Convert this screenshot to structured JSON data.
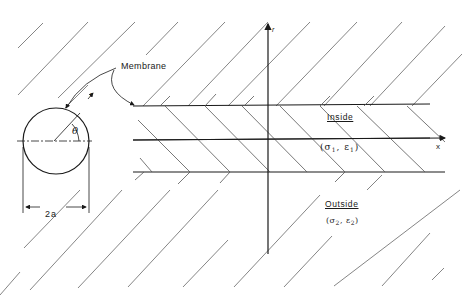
{
  "diagram": {
    "type": "cylindrical-membrane-cross-section",
    "labels": {
      "membrane": "Membrane",
      "inside": "Inside",
      "outside": "Outside",
      "inside_props_open": "(σ",
      "inside_props_sub1": "1",
      "inside_props_mid": ", ε",
      "inside_props_sub2": "1",
      "inside_props_close": ")",
      "outside_props_open": "(σ",
      "outside_props_sub1": "2",
      "outside_props_mid": ", ε",
      "outside_props_sub2": "2",
      "outside_props_close": ")",
      "x_axis": "x",
      "r_axis": "r",
      "r_circle": "r",
      "theta": "θ",
      "diameter": "2a"
    },
    "colors": {
      "line": "#1a1a1a",
      "hatch": "#555555",
      "background": "#ffffff"
    }
  }
}
